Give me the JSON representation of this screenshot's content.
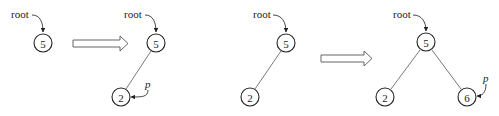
{
  "diagram": {
    "colors": {
      "stroke": "#222222",
      "background": "#ffffff"
    },
    "panels": [
      {
        "id": "panel-1",
        "root_label": "root",
        "nodes": [
          {
            "id": "n5",
            "value": "5"
          }
        ],
        "edges": [],
        "pointer_label": null
      },
      {
        "id": "panel-2",
        "root_label": "root",
        "nodes": [
          {
            "id": "n5",
            "value": "5"
          },
          {
            "id": "n2",
            "value": "2"
          }
        ],
        "edges": [
          [
            "n5",
            "n2"
          ]
        ],
        "pointer_label": "p",
        "pointer_target": "n2"
      },
      {
        "id": "panel-3",
        "root_label": "root",
        "nodes": [
          {
            "id": "n5",
            "value": "5"
          },
          {
            "id": "n2",
            "value": "2"
          }
        ],
        "edges": [
          [
            "n5",
            "n2"
          ]
        ],
        "pointer_label": null
      },
      {
        "id": "panel-4",
        "root_label": "root",
        "nodes": [
          {
            "id": "n5",
            "value": "5"
          },
          {
            "id": "n2",
            "value": "2"
          },
          {
            "id": "n6",
            "value": "6"
          }
        ],
        "edges": [
          [
            "n5",
            "n2"
          ],
          [
            "n5",
            "n6"
          ]
        ],
        "pointer_label": "p",
        "pointer_target": "n6"
      }
    ],
    "transitions": [
      {
        "from": "panel-1",
        "to": "panel-2",
        "icon": "hollow-right-arrow-icon"
      },
      {
        "from": "panel-3",
        "to": "panel-4",
        "icon": "hollow-right-arrow-icon"
      }
    ]
  }
}
